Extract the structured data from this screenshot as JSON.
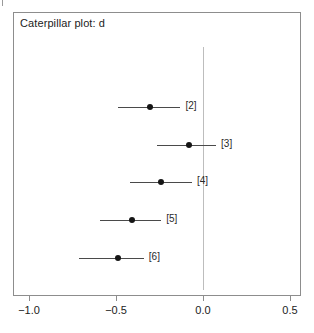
{
  "figure": {
    "title": "Caterpillar plot: d",
    "background_color": "#ffffff",
    "frame_color": "#8d8d8d",
    "zero_line_color": "#bdbdbd",
    "interval_color": "#4a4a4a",
    "point_color": "#151515"
  },
  "axis": {
    "tick_labels": [
      "−1.0",
      "−0.5",
      "0.0",
      "0.5"
    ],
    "tick_values": [
      -1.0,
      -0.5,
      0.0,
      0.5
    ]
  },
  "rows": [
    {
      "label": "[2]",
      "estimate": -0.305,
      "lower": -0.49,
      "upper": -0.13
    },
    {
      "label": "[3]",
      "estimate": -0.08,
      "lower": -0.265,
      "upper": 0.075
    },
    {
      "label": "[4]",
      "estimate": -0.24,
      "lower": -0.42,
      "upper": -0.063
    },
    {
      "label": "[5]",
      "estimate": -0.41,
      "lower": -0.59,
      "upper": -0.24
    },
    {
      "label": "[6]",
      "estimate": -0.49,
      "lower": -0.71,
      "upper": -0.34
    }
  ],
  "chart_data": {
    "type": "scatter",
    "title": "Caterpillar plot: d",
    "xlabel": "",
    "ylabel": "",
    "xlim": [
      -1.15,
      0.57
    ],
    "grid": false,
    "legend": null,
    "reference_line": {
      "orientation": "vertical",
      "value": 0.0,
      "color": "#bdbdbd"
    },
    "xticks": [
      -1.0,
      -0.5,
      0.0,
      0.5
    ],
    "xticklabels": [
      "−1.0",
      "−0.5",
      "0.0",
      "0.5"
    ],
    "categories": [
      "[2]",
      "[3]",
      "[4]",
      "[5]",
      "[6]"
    ],
    "values": [
      -0.305,
      -0.08,
      -0.24,
      -0.41,
      -0.49
    ],
    "error_low": [
      -0.49,
      -0.265,
      -0.42,
      -0.59,
      -0.71
    ],
    "error_high": [
      -0.13,
      0.075,
      -0.063,
      -0.24,
      -0.34
    ],
    "series": [
      {
        "name": "d",
        "points": [
          {
            "label": "[2]",
            "estimate": -0.305,
            "ci_lower": -0.49,
            "ci_upper": -0.13
          },
          {
            "label": "[3]",
            "estimate": -0.08,
            "ci_lower": -0.265,
            "ci_upper": 0.075
          },
          {
            "label": "[4]",
            "estimate": -0.24,
            "ci_lower": -0.42,
            "ci_upper": -0.063
          },
          {
            "label": "[5]",
            "estimate": -0.41,
            "ci_lower": -0.59,
            "ci_upper": -0.24
          },
          {
            "label": "[6]",
            "estimate": -0.49,
            "ci_lower": -0.71,
            "ci_upper": -0.34
          }
        ]
      }
    ]
  },
  "geometry": {
    "x_pixel_at_zero": 203,
    "pixels_per_unit": 174,
    "row_y": [
      107,
      145,
      182,
      220,
      258
    ],
    "zero_line_top": 47,
    "zero_line_bottom": 290
  }
}
